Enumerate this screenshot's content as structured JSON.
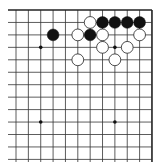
{
  "board": {
    "label": "Go board - top-right corner",
    "region": "top-right corner",
    "colors": {
      "background": "#ffffff",
      "line": "#333333",
      "edge": "#222222",
      "black_stone": "#111111",
      "white_stone": "#ffffff",
      "white_stone_border": "#222222",
      "star_point": "#111111"
    },
    "grid": {
      "columns": 12,
      "rows": 13,
      "x0": 16,
      "y0": 10,
      "dx": 12.36,
      "dy": 12.45,
      "left_extent": 8,
      "bottom_extent": 162,
      "top_edge": true,
      "right_edge": true
    },
    "star_points": [
      {
        "col": 2,
        "row": 3
      },
      {
        "col": 8,
        "row": 3
      },
      {
        "col": 2,
        "row": 9
      },
      {
        "col": 8,
        "row": 9
      }
    ],
    "stones": [
      {
        "color": "white",
        "col": 6,
        "row": 1
      },
      {
        "color": "black",
        "col": 7,
        "row": 1
      },
      {
        "color": "black",
        "col": 8,
        "row": 1
      },
      {
        "color": "black",
        "col": 9,
        "row": 1
      },
      {
        "color": "black",
        "col": 10,
        "row": 1
      },
      {
        "color": "black",
        "col": 3,
        "row": 2
      },
      {
        "color": "white",
        "col": 5,
        "row": 2
      },
      {
        "color": "black",
        "col": 6,
        "row": 2
      },
      {
        "color": "white",
        "col": 7,
        "row": 2
      },
      {
        "color": "white",
        "col": 10,
        "row": 2
      },
      {
        "color": "white",
        "col": 7,
        "row": 3
      },
      {
        "color": "white",
        "col": 9,
        "row": 3
      },
      {
        "color": "white",
        "col": 5,
        "row": 4
      },
      {
        "color": "white",
        "col": 8,
        "row": 4
      }
    ]
  }
}
